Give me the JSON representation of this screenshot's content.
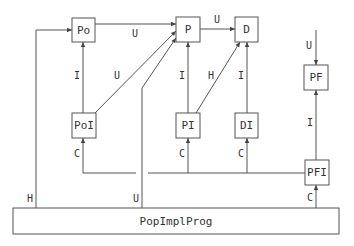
{
  "nodes": {
    "po": "Po",
    "p": "P",
    "d": "D",
    "poi": "PoI",
    "pi": "PI",
    "di": "DI",
    "pf": "PF",
    "pfi": "PFI",
    "popimplprog": "PopImplProg"
  },
  "edges": {
    "po_p": "U",
    "p_d": "U",
    "poi_po": "I",
    "poi_p": "U",
    "pi_p": "I",
    "pi_d": "H",
    "di_d": "I",
    "top_pf": "U",
    "pfi_pf": "I",
    "bus_poi": "C",
    "bus_pi": "C",
    "bus_di": "C",
    "prog_pfi": "C",
    "prog_po": "H",
    "prog_p": "U"
  }
}
